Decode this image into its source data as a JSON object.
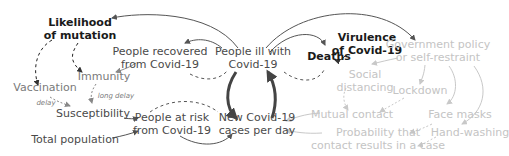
{
  "diagram": {
    "type": "causal-loop",
    "colors": {
      "strong": "#1a1a1a",
      "normal": "#4a4a4a",
      "muted": "#7a7a7a",
      "faded": "#c4c4c4"
    },
    "nodes": {
      "likelihood_of_mutation": "Likelihood\nof mutation",
      "people_recovered": "People recovered\nfrom Covid-19",
      "people_ill": "People ill with\nCovid-19",
      "deaths": "Deaths",
      "virulence": "Virulence\nof Covid-19",
      "government_policy": "Government policy\nor self-restraint",
      "immunity": "Immunity",
      "vaccination": "Vaccination",
      "social_distancing": "Social\ndistancing",
      "lockdown": "Lockdown",
      "susceptibility": "Susceptibility",
      "people_at_risk": "People at risk\nfrom Covid-19",
      "new_cases": "New Covid-19\ncases per day",
      "mutual_contact": "Mutual contact",
      "face_masks": "Face masks",
      "hand_washing": "Hand-washing",
      "probability_contact": "Probability that\ncontact results in a case",
      "total_population": "Total population"
    },
    "edge_labels": {
      "delay": "delay",
      "long_delay": "long delay"
    }
  }
}
